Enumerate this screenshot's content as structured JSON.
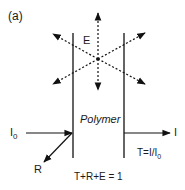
{
  "panel_label": "(a)",
  "labels": {
    "emission": "E",
    "material": "Polymer",
    "incident": "I",
    "incident_sub": "0",
    "transmitted": "I",
    "reflected": "R",
    "transmittance_eq": "T=I/I",
    "transmittance_eq_sub": "0",
    "conservation_eq": "T+R+E = 1"
  },
  "colors": {
    "stroke": "#111111",
    "background": "#ffffff"
  }
}
